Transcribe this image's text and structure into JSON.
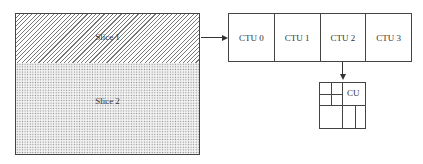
{
  "picture": {
    "slices": [
      {
        "label": "Slice 1",
        "pattern": "diagonal-hatch"
      },
      {
        "label": "Slice 2",
        "pattern": "dotted"
      }
    ]
  },
  "ctu_row": {
    "units": [
      {
        "label": "CTU 0"
      },
      {
        "label": "CTU 1"
      },
      {
        "label": "CTU 2"
      },
      {
        "label": "CTU 3"
      }
    ]
  },
  "cu_block": {
    "label": "CU"
  },
  "colors": {
    "stroke": "#444444",
    "hatch": "#777777",
    "dots": "#8a8a8a"
  }
}
